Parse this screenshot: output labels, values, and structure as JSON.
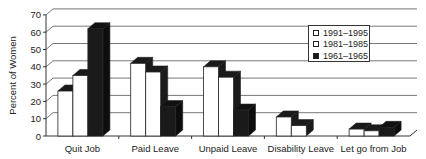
{
  "chart_data": {
    "type": "bar",
    "style": "3d-clustered",
    "title": "",
    "xlabel": "",
    "ylabel": "Percent of Women",
    "ylim": [
      0,
      70
    ],
    "yticks": [
      0,
      10,
      20,
      30,
      40,
      50,
      60,
      70
    ],
    "grid": true,
    "legend_position": "upper right",
    "categories": [
      "Quit Job",
      "Paid Leave",
      "Unpaid Leave",
      "Disability Leave",
      "Let go from Job"
    ],
    "series": [
      {
        "name": "1991–1995",
        "color": "#ffffff",
        "values": [
          26,
          42,
          40,
          11,
          4
        ]
      },
      {
        "name": "1981–1985",
        "color": "#ffffff",
        "values": [
          35,
          37,
          34,
          6,
          3
        ]
      },
      {
        "name": "1961–1965",
        "color": "#1a1a1a",
        "values": [
          62,
          17,
          15,
          0,
          5
        ]
      }
    ]
  }
}
